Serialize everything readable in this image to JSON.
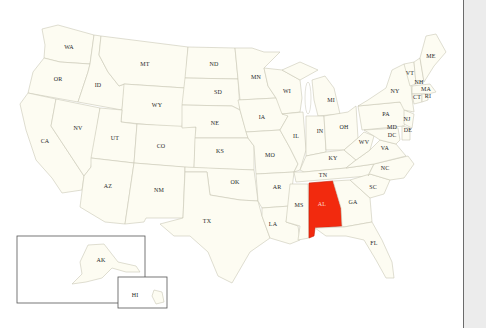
{
  "map": {
    "title": "United States map",
    "highlighted_state": "AL",
    "colors": {
      "state_fill": "#fdfcf2",
      "state_border": "#c9c7b6",
      "highlight_fill": "#f22a0e",
      "background": "#ffffff",
      "side_panel": "#ececec"
    },
    "labels": {
      "WA": "WA",
      "OR": "OR",
      "CA": "CA",
      "ID": "ID",
      "NV": "NV",
      "MT": "MT",
      "WY": "WY",
      "UT": "UT",
      "AZ": "AZ",
      "CO": "CO",
      "NM": "NM",
      "ND": "ND",
      "SD": "SD",
      "NE": "NE",
      "KS": "KS",
      "OK": "OK",
      "TX": "TX",
      "MN": "MN",
      "IA": "IA",
      "MO": "MO",
      "AR": "AR",
      "LA": "LA",
      "WI": "WI",
      "IL": "IL",
      "MS": "MS",
      "MI": "MI",
      "IN": "IN",
      "KY": "KY",
      "TN": "TN",
      "AL": "AL",
      "OH": "OH",
      "GA": "GA",
      "FL": "FL",
      "SC": "SC",
      "NC": "NC",
      "VA": "VA",
      "WV": "WV",
      "PA": "PA",
      "NY": "NY",
      "VT": "VT",
      "NH": "NH",
      "ME": "ME",
      "MA": "MA",
      "RI": "RI",
      "CT": "CT",
      "NJ": "NJ",
      "DE": "DE",
      "MD": "MD",
      "DC": "DC",
      "AK": "AK",
      "HI": "HI"
    }
  }
}
